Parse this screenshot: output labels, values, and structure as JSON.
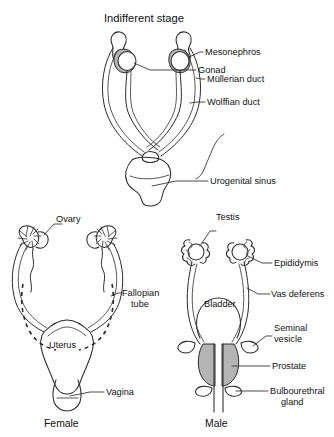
{
  "figure": {
    "background_color": "#ffffff",
    "ink_color": "#2b2b2b",
    "shade_color": "#b4b4b4",
    "panels": {
      "indifferent": {
        "title": "Indifferent stage",
        "labels": {
          "gonad": "Gonad",
          "mesonephros": "Mesonephros",
          "mullerian_duct": "Müllerian duct",
          "wolffian_duct": "Wolffian duct",
          "urogenital_sinus": "Urogenital sinus"
        }
      },
      "female": {
        "caption": "Female",
        "labels": {
          "ovary": "Ovary",
          "fallopian_tube_line1": "Fallopian",
          "fallopian_tube_line2": "tube",
          "uterus": "Uterus",
          "vagina": "Vagina"
        }
      },
      "male": {
        "caption": "Male",
        "labels": {
          "testis": "Testis",
          "epididymis": "Epididymis",
          "vas_deferens": "Vas deferens",
          "bladder": "Bladder",
          "seminal_vesicle_line1": "Seminal",
          "seminal_vesicle_line2": "vesicle",
          "prostate": "Prostate",
          "bulbourethral_line1": "Bulbourethral",
          "bulbourethral_line2": "gland"
        }
      }
    }
  }
}
